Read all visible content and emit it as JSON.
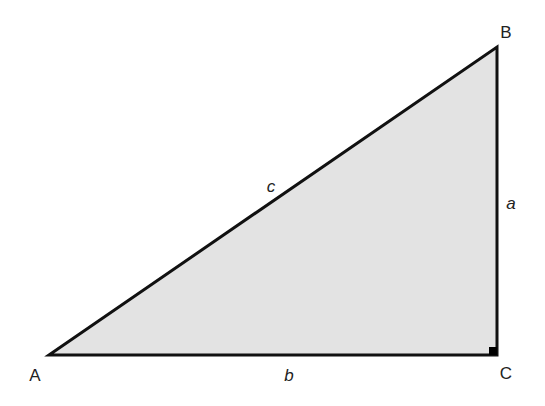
{
  "diagram": {
    "type": "right-triangle",
    "fill_color": "#e3e3e3",
    "stroke_color": "#111111",
    "vertices": {
      "A": {
        "label": "A",
        "x": 49,
        "y": 355
      },
      "B": {
        "label": "B",
        "x": 497,
        "y": 47
      },
      "C": {
        "label": "C",
        "x": 497,
        "y": 355
      }
    },
    "sides": {
      "a": {
        "label": "a",
        "between": "B-C"
      },
      "b": {
        "label": "b",
        "between": "A-C"
      },
      "c": {
        "label": "c",
        "between": "A-B"
      }
    },
    "right_angle_at": "C"
  }
}
